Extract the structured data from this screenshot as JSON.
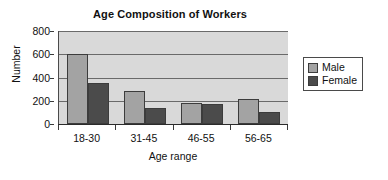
{
  "chart_data": {
    "type": "bar",
    "title": "Age Composition of Workers",
    "xlabel": "Age range",
    "ylabel": "Number",
    "categories": [
      "18-30",
      "31-45",
      "46-55",
      "56-65"
    ],
    "series": [
      {
        "name": "Male",
        "color": "#a3a3a3",
        "values": [
          600,
          280,
          185,
          215
        ]
      },
      {
        "name": "Female",
        "color": "#4b4b4b",
        "values": [
          350,
          140,
          170,
          100
        ]
      }
    ],
    "ylim": [
      0,
      800
    ],
    "yticks": [
      800,
      600,
      400,
      200,
      0
    ],
    "ytick_labels": [
      "800",
      "600",
      "400",
      "200",
      "0"
    ],
    "grid": true,
    "grid_axis": "y",
    "legend_position": "right",
    "plot_background": "#d9d9d9",
    "gridline_color": "#6a6a6a",
    "axis_color": "#2b2b2b"
  }
}
